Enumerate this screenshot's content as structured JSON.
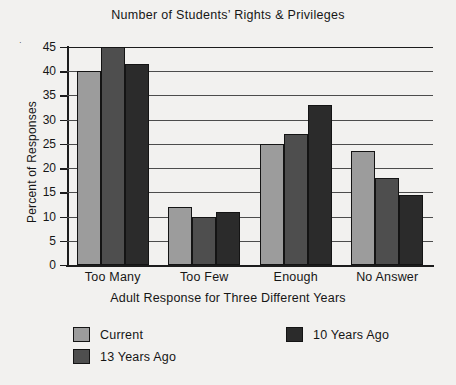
{
  "chart_data": {
    "type": "bar",
    "title": "Number of Students’ Rights & Privileges",
    "xlabel": "Adult Response for Three Different Years",
    "ylabel": "Percent of Responses",
    "categories": [
      "Too Many",
      "Too Few",
      "Enough",
      "No Answer"
    ],
    "series": [
      {
        "name": "Current",
        "color": "#9c9c9c",
        "values": [
          40,
          12,
          25,
          23.5
        ]
      },
      {
        "name": "13 Years Ago",
        "color": "#4e4e4e",
        "values": [
          45,
          10,
          27,
          18
        ]
      },
      {
        "name": "10 Years Ago",
        "color": "#2b2b2b",
        "values": [
          41.5,
          11,
          33,
          14.5
        ]
      }
    ],
    "ylim": [
      0,
      45
    ],
    "yticks": [
      0,
      5,
      10,
      15,
      20,
      25,
      30,
      35,
      40,
      45
    ],
    "ytick_labels": [
      "0",
      "5",
      "10",
      "15",
      "20",
      "25",
      "30",
      "35",
      "40",
      "45"
    ],
    "grid": "horizontal",
    "legend_position": "below-left",
    "legend_order": [
      "Current",
      "13 Years Ago",
      "10 Years Ago"
    ],
    "background_color": "#f2f1ef",
    "axis_color": "#1c1c1c"
  }
}
